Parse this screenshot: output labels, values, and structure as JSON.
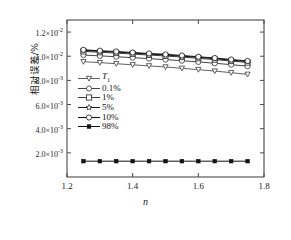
{
  "chart_data": {
    "type": "line",
    "title": "",
    "xlabel": "n",
    "ylabel": "相对误差/%",
    "xlim": [
      1.2,
      1.8
    ],
    "ylim": [
      0.0,
      0.013
    ],
    "xticks": [
      "1.2",
      "1.4",
      "1.6",
      "1.8"
    ],
    "xtick_values": [
      1.2,
      1.4,
      1.6,
      1.8
    ],
    "yticks": [
      "2.0×10⁻³",
      "4.0×10⁻³",
      "6.0×10⁻³",
      "8.0×10⁻³",
      "1.0×10⁻²",
      "1.2×10⁻²"
    ],
    "ytick_values": [
      0.002,
      0.004,
      0.006,
      0.008,
      0.01,
      0.012
    ],
    "ytick_mantissa": [
      "2.0×10",
      "4.0×10",
      "6.0×10",
      "8.0×10",
      "1.0×10",
      "1.2×10"
    ],
    "ytick_exponent": [
      "-3",
      "-3",
      "-3",
      "-3",
      "-2",
      "-2"
    ],
    "grid": false,
    "legend_position": "center-left",
    "x": [
      1.25,
      1.3,
      1.35,
      1.4,
      1.45,
      1.5,
      1.55,
      1.6,
      1.65,
      1.7,
      1.75
    ],
    "series": [
      {
        "name": "T₁",
        "label_html": "<i>T</i><sub>1</sub>",
        "marker": "triangle-down-open",
        "color": "#3a3a3a",
        "linewidth": 0.8,
        "values": [
          0.00955,
          0.00947,
          0.00938,
          0.00929,
          0.0092,
          0.00911,
          0.009,
          0.00889,
          0.00877,
          0.00864,
          0.0085
        ]
      },
      {
        "name": "0.1%",
        "label_html": "0.1%",
        "marker": "circle-open",
        "color": "#2e2e2e",
        "linewidth": 0.9,
        "values": [
          0.0101,
          0.01003,
          0.00996,
          0.00988,
          0.0098,
          0.00972,
          0.00963,
          0.00953,
          0.00942,
          0.0093,
          0.00918
        ]
      },
      {
        "name": "1%",
        "label_html": "1%",
        "marker": "square-open",
        "color": "#262626",
        "linewidth": 0.9,
        "values": [
          0.0104,
          0.01033,
          0.01026,
          0.01018,
          0.0101,
          0.01002,
          0.00993,
          0.00983,
          0.00972,
          0.0096,
          0.00948
        ]
      },
      {
        "name": "5%",
        "label_html": "5%",
        "marker": "star-open",
        "color": "#1c1c1c",
        "linewidth": 1.0,
        "values": [
          0.01048,
          0.01041,
          0.01034,
          0.01026,
          0.01018,
          0.0101,
          0.01001,
          0.00991,
          0.0098,
          0.00968,
          0.00956
        ]
      },
      {
        "name": "10%",
        "label_html": "10%",
        "marker": "circle-open",
        "color": "#141414",
        "linewidth": 1.1,
        "values": [
          0.01053,
          0.01046,
          0.01039,
          0.01031,
          0.01023,
          0.01015,
          0.01006,
          0.00996,
          0.00985,
          0.00973,
          0.00961
        ]
      },
      {
        "name": "98%",
        "label_html": "98%",
        "marker": "square-filled",
        "color": "#111111",
        "linewidth": 1.0,
        "values": [
          0.00131,
          0.00131,
          0.00131,
          0.00131,
          0.00131,
          0.00131,
          0.00131,
          0.00131,
          0.00131,
          0.00131,
          0.00131
        ]
      }
    ]
  },
  "axes": {
    "frame_color": "#4a4a4a"
  }
}
